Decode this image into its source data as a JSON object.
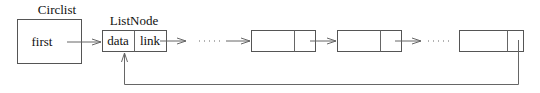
{
  "diagram": {
    "type": "circular-linked-list",
    "circlist": {
      "label": "Circlist",
      "field": "first"
    },
    "listnode": {
      "label": "ListNode",
      "data_field": "data",
      "link_field": "link"
    },
    "node_count_shown": 4,
    "ellipses": 2,
    "colors": {
      "line": "#666666",
      "box_stroke": "#555555",
      "text": "#111111",
      "background": "#ffffff"
    }
  }
}
